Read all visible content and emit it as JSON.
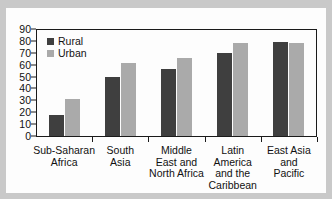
{
  "chart_data": {
    "type": "bar",
    "title": "",
    "subtitle": "",
    "xlabel": "",
    "ylabel": "",
    "ylim": [
      0,
      90
    ],
    "ytick_step": 10,
    "yticks": [
      "0",
      "10",
      "20",
      "30",
      "40",
      "50",
      "60",
      "70",
      "80",
      "90"
    ],
    "grid": false,
    "legend_position": "top-left-inside",
    "categories": [
      "Sub-Saharan\nAfrica",
      "South\nAsia",
      "Middle\nEast and\nNorth Africa",
      "Latin\nAmerica\nand the\nCaribbean",
      "East Asia\nand\nPacific"
    ],
    "series": [
      {
        "name": "Rural",
        "color": "#3f3f3f",
        "values": [
          18,
          50,
          56,
          70,
          79
        ]
      },
      {
        "name": "Urban",
        "color": "#aaaaaa",
        "values": [
          31,
          61,
          66,
          78,
          78
        ]
      }
    ]
  },
  "legend": {
    "items": [
      {
        "label": "Rural"
      },
      {
        "label": "Urban"
      }
    ]
  },
  "colors": {
    "rural": "#3f3f3f",
    "urban": "#aaaaaa",
    "axis": "#1a1a1a",
    "frame": "#c9c9c9",
    "card": "#fdfdfd"
  }
}
